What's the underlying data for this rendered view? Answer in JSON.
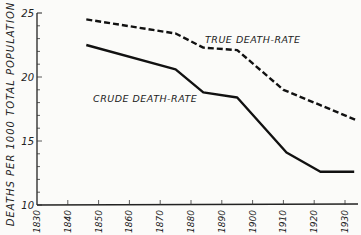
{
  "chart_data": {
    "type": "line",
    "title": "",
    "xlabel": "",
    "ylabel": "DEATHS PER 1000 TOTAL POPULATION",
    "xlim": [
      1830,
      1935
    ],
    "ylim": [
      10,
      25
    ],
    "x_ticks": [
      "1830",
      "1840",
      "1850",
      "1860",
      "1870",
      "1880",
      "1890",
      "1900",
      "1910",
      "1920",
      "1930"
    ],
    "y_ticks": [
      "10",
      "15",
      "20",
      "25"
    ],
    "grid": false,
    "legend": "inline labels",
    "series": [
      {
        "name": "TRUE DEATH-RATE",
        "style": "dashed",
        "x": [
          1846,
          1875,
          1884,
          1895,
          1910,
          1922,
          1934
        ],
        "y": [
          24.5,
          23.4,
          22.3,
          22.1,
          19.0,
          17.8,
          16.6
        ]
      },
      {
        "name": "CRUDE DEATH-RATE",
        "style": "solid",
        "x": [
          1846,
          1875,
          1884,
          1895,
          1911,
          1922,
          1933
        ],
        "y": [
          22.5,
          20.6,
          18.8,
          18.4,
          14.1,
          12.6,
          12.6
        ]
      }
    ]
  }
}
